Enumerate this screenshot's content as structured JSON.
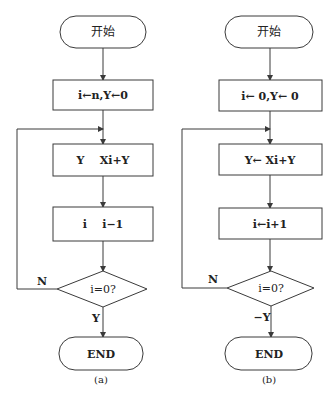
{
  "diagrams": [
    {
      "id": "a",
      "caption": "(a)",
      "start_label": "开始",
      "init_label": "i←n,Y←0",
      "step1_label": "Y    Xi+Y",
      "step2_label": "i    i−1",
      "decision_label": "i=0?",
      "no_label": "N",
      "yes_label": "Y",
      "end_label": "END"
    },
    {
      "id": "b",
      "caption": "(b)",
      "start_label": "开始",
      "init_label": "i← 0,Y← 0",
      "step1_label": "Y← Xi+Y",
      "step2_label": "i←i+1",
      "decision_label": "i=0?",
      "no_label": "N",
      "yes_label": "−Y",
      "end_label": "END"
    }
  ]
}
